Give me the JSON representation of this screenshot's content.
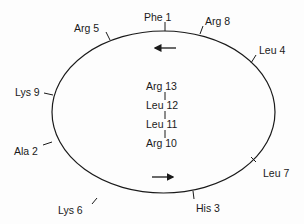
{
  "diagram": {
    "type": "cyclic-peptide-schematic",
    "ring": {
      "residues": [
        {
          "label": "Phe 1",
          "x": 144,
          "y": 11,
          "tick": [
            165,
            22,
            165,
            31
          ]
        },
        {
          "label": "Arg 8",
          "x": 205,
          "y": 15,
          "tick": [
            203,
            26,
            200,
            34
          ]
        },
        {
          "label": "Leu 4",
          "x": 259,
          "y": 44,
          "tick": [
            256,
            55,
            251,
            63
          ]
        },
        {
          "label": "Arg 5",
          "x": 74,
          "y": 22,
          "tick": [
            106,
            32,
            110,
            40
          ]
        },
        {
          "label": "Lys 9",
          "x": 15,
          "y": 86,
          "tick": [
            44,
            93,
            53,
            95
          ]
        },
        {
          "label": "Ala 2",
          "x": 14,
          "y": 145,
          "tick": [
            43,
            145,
            52,
            142
          ]
        },
        {
          "label": "Lys 6",
          "x": 58,
          "y": 204,
          "tick": [
            92,
            204,
            97,
            198
          ]
        },
        {
          "label": "Leu 7",
          "x": 263,
          "y": 167,
          "tick": [
            256,
            162,
            251,
            157
          ]
        },
        {
          "label": "His 3",
          "x": 196,
          "y": 202,
          "tick": [
            194,
            199,
            193,
            191
          ]
        }
      ],
      "arrows": [
        {
          "direction": "left",
          "x1": 176,
          "y1": 48,
          "x2": 155,
          "y2": 48
        },
        {
          "direction": "right",
          "x1": 152,
          "y1": 177,
          "x2": 173,
          "y2": 177
        }
      ]
    },
    "tail": {
      "residues": [
        {
          "label": "Arg 13",
          "x": 146,
          "y": 80
        },
        {
          "label": "Leu 12",
          "x": 146,
          "y": 99
        },
        {
          "label": "Leu 11",
          "x": 146,
          "y": 118
        },
        {
          "label": "Arg 10",
          "x": 146,
          "y": 137
        }
      ]
    },
    "colors": {
      "line": "#1a1a1a",
      "background": "#fdfdfd"
    }
  }
}
